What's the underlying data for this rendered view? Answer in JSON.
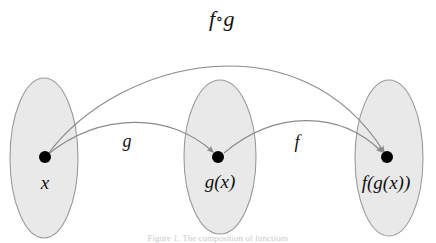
{
  "figure": {
    "caption": "Figure 1. The composition of functions",
    "background_color": "#ffffff"
  },
  "style": {
    "ellipse_fill": "#e9e9e9",
    "ellipse_stroke": "#9a9a9a",
    "arrow_color": "#8a8a8a",
    "dot_color": "#000000",
    "text_color": "#111111"
  },
  "sets": [
    {
      "id": "domain",
      "label": "x",
      "element_label": "x",
      "cx": 44,
      "cy": 158,
      "rx": 34,
      "ry": 80,
      "dot_x": 45,
      "dot_y": 157,
      "label_x": 45,
      "label_y": 172
    },
    {
      "id": "intermediate",
      "label": "g(x)",
      "element_label": "g ( x )",
      "cx": 220,
      "cy": 157,
      "rx": 36,
      "ry": 77,
      "dot_x": 218,
      "dot_y": 157,
      "label_x": 220,
      "label_y": 171
    },
    {
      "id": "codomain",
      "label": "f(g(x))",
      "element_label": "f ( g ( x ) )",
      "cx": 389,
      "cy": 158,
      "rx": 34,
      "ry": 78,
      "dot_x": 387,
      "dot_y": 157,
      "label_x": 386,
      "label_y": 172
    }
  ],
  "arrows": [
    {
      "id": "g-arrow",
      "label": "g",
      "from": "x",
      "to": "g(x)",
      "label_x": 127,
      "label_y": 131,
      "path": "M 47 155 C 100 112, 170 112, 213 152"
    },
    {
      "id": "f-arrow",
      "label": "f",
      "from": "g(x)",
      "to": "f(g(x))",
      "label_x": 297,
      "label_y": 132,
      "path": "M 224 153 C 275 110, 340 110, 382 152"
    },
    {
      "id": "fog-arrow",
      "label": "f∘g",
      "from": "x",
      "to": "f(g(x))",
      "label_x": 222,
      "label_y": 8,
      "path": "M 48 154 C 120 58, 300 18, 384 152"
    }
  ],
  "composition_label": {
    "f": "f",
    "ring": "∘",
    "g": "g"
  }
}
